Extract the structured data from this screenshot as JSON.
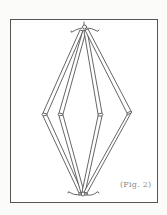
{
  "figure": {
    "caption": "(Fig. 2)",
    "stroke_color": "#555555",
    "frame_color": "#555555",
    "background": "#ffffff"
  }
}
